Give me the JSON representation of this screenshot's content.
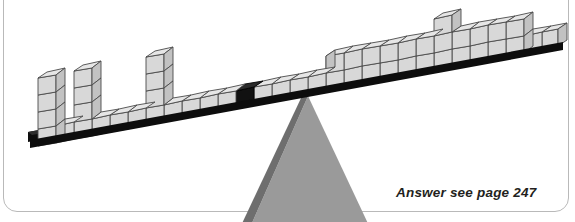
{
  "page": {
    "width": 575,
    "height": 222,
    "background_color": "#ffffff",
    "border_color": "#b9b9b9"
  },
  "puzzle": {
    "title": "",
    "type": "balance-beam-cube-puzzle",
    "description": "A long beam of cubes resting on a triangular fulcrum, tilted down to the left",
    "answer_note": {
      "prefix": "Answer see page",
      "page_number": "247",
      "full_text": "Answer see page 247"
    }
  },
  "colors": {
    "cube_front": "#d8d8d8",
    "cube_top": "#e6e6e6",
    "cube_side": "#c2c2c2",
    "cube_outline": "#4a4a4a",
    "cube_black": "#111111",
    "beam": "#0d0d0d",
    "fulcrum_face": "#9a9a9a",
    "fulcrum_edge": "#6e6e6e",
    "text": "#231f20",
    "card_border": "#b9b9b9"
  },
  "beam": {
    "name": "tilted-beam",
    "left_end_x": 30,
    "left_end_y": 138,
    "right_end_x": 560,
    "right_end_y": 42,
    "thickness": 7,
    "pivot_marker": {
      "name": "black-center-cube",
      "index_from_left": 17,
      "color": "#111111",
      "count": 1
    }
  },
  "cube_layout": {
    "cube_size": 17,
    "total_columns": 29,
    "left_arm_columns": 17,
    "right_arm_columns": 12,
    "heights_from_left": [
      4,
      1,
      1,
      1,
      4,
      1,
      1,
      1,
      4,
      1,
      1,
      1,
      1,
      1,
      1,
      1,
      1,
      1,
      1,
      1,
      2,
      2,
      3,
      2,
      2,
      2,
      2,
      2,
      1
    ],
    "towers": [
      {
        "name": "tower-1",
        "column": 1,
        "height": 4
      },
      {
        "name": "tower-2",
        "column": 5,
        "height": 4
      },
      {
        "name": "tower-3",
        "column": 9,
        "height": 4
      },
      {
        "name": "tower-4",
        "column": 23,
        "height": 3
      }
    ]
  },
  "fulcrum": {
    "name": "triangular-fulcrum",
    "apex_x": 308,
    "apex_y": 96,
    "base_left_x": 245,
    "base_right_x": 370,
    "base_y": 232,
    "fill": "#9a9a9a",
    "edge": "#6e6e6e"
  }
}
